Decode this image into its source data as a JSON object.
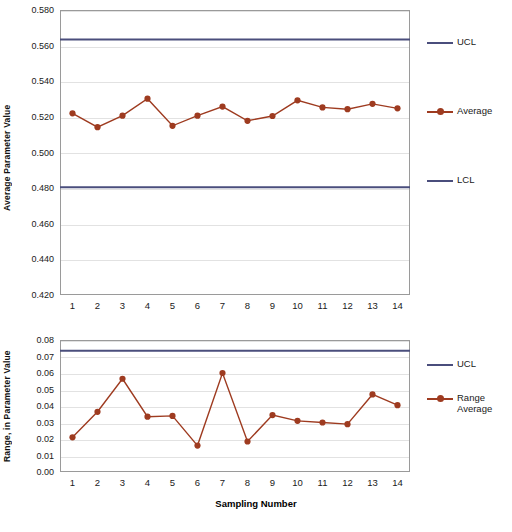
{
  "colors": {
    "series": "#9E3B20",
    "limit": "#4A4E7C",
    "grid": "#E2E2E2",
    "axis": "#9A9A9A",
    "text": "#1A1A1A",
    "background": "#FFFFFF"
  },
  "chart_data": [
    {
      "type": "line",
      "name": "x-bar-control-chart",
      "title": "",
      "xlabel": "",
      "ylabel": "Average Parameter Value",
      "categories": [
        "1",
        "2",
        "3",
        "4",
        "5",
        "6",
        "7",
        "8",
        "9",
        "10",
        "11",
        "12",
        "13",
        "14"
      ],
      "x": [
        1,
        2,
        3,
        4,
        5,
        6,
        7,
        8,
        9,
        10,
        11,
        12,
        13,
        14
      ],
      "ylim": [
        0.42,
        0.58
      ],
      "yticks": [
        "0.580",
        "0.560",
        "0.540",
        "0.520",
        "0.500",
        "0.480",
        "0.460",
        "0.440",
        "0.420"
      ],
      "ytick_values": [
        0.58,
        0.56,
        0.54,
        0.52,
        0.5,
        0.48,
        0.46,
        0.44,
        0.42
      ],
      "grid": true,
      "legend_position": "right",
      "series": [
        {
          "name": "Average",
          "type": "line-marker",
          "values": [
            0.522,
            0.5142,
            0.5207,
            0.5302,
            0.515,
            0.5207,
            0.5258,
            0.5178,
            0.5205,
            0.5293,
            0.5253,
            0.5243,
            0.5273,
            0.5248
          ]
        },
        {
          "name": "UCL",
          "type": "limit-line",
          "value": 0.5635
        },
        {
          "name": "LCL",
          "type": "limit-line",
          "value": 0.4805
        }
      ],
      "legend": [
        {
          "label": "UCL",
          "kind": "limit"
        },
        {
          "label": "Average",
          "kind": "series"
        },
        {
          "label": "LCL",
          "kind": "limit"
        }
      ]
    },
    {
      "type": "line",
      "name": "range-control-chart",
      "title": "",
      "xlabel": "Sampling Number",
      "ylabel": "Range, in Parameter Value",
      "categories": [
        "1",
        "2",
        "3",
        "4",
        "5",
        "6",
        "7",
        "8",
        "9",
        "10",
        "11",
        "12",
        "13",
        "14"
      ],
      "x": [
        1,
        2,
        3,
        4,
        5,
        6,
        7,
        8,
        9,
        10,
        11,
        12,
        13,
        14
      ],
      "ylim": [
        0.0,
        0.08
      ],
      "yticks": [
        "0.08",
        "0.07",
        "0.06",
        "0.05",
        "0.04",
        "0.03",
        "0.02",
        "0.01",
        "0.00"
      ],
      "ytick_values": [
        0.08,
        0.07,
        0.06,
        0.05,
        0.04,
        0.03,
        0.02,
        0.01,
        0.0
      ],
      "grid": true,
      "legend_position": "right",
      "series": [
        {
          "name": "Range Average",
          "type": "line-marker",
          "values": [
            0.021,
            0.0365,
            0.0565,
            0.0335,
            0.034,
            0.016,
            0.06,
            0.0185,
            0.0345,
            0.031,
            0.03,
            0.029,
            0.047,
            0.0405
          ]
        },
        {
          "name": "UCL",
          "type": "limit-line",
          "value": 0.0735
        }
      ],
      "legend": [
        {
          "label": "UCL",
          "kind": "limit"
        },
        {
          "label": "Range\nAverage",
          "kind": "series"
        }
      ]
    }
  ],
  "legend_top": {
    "ucl": "UCL",
    "average": "Average",
    "lcl": "LCL"
  },
  "legend_bottom": {
    "ucl": "UCL",
    "range_average_line1": "Range",
    "range_average_line2": "Average"
  },
  "axis_titles": {
    "top_y": "Average Parameter Value",
    "bottom_y": "Range, in Parameter Value",
    "bottom_x": "Sampling Number"
  }
}
